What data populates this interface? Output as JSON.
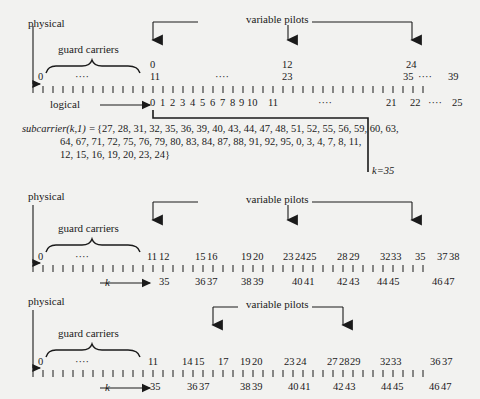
{
  "figure": {
    "background_color": "#f2f2f0",
    "ink_color": "#1a1a1a"
  },
  "common_labels": {
    "physical": "physical",
    "logical": "logical",
    "guard_carriers": "guard carriers",
    "variable_pilots": "variable pilots",
    "k_symbol": "k",
    "dots": "····"
  },
  "formula": {
    "name": "subcarrier(k,1) =",
    "line1": "{27, 28, 31, 32, 35, 36, 39, 40, 43, 44, 47, 48, 51, 52, 55, 56, 59, 60, 63,",
    "line2": "64, 67, 71, 72, 75, 76, 79, 80, 83, 84, 87, 88, 91, 92, 95, 0, 3, 4, 7, 8, 11,",
    "line3": "12, 15, 16, 19, 20, 23, 24}",
    "k_annotation": "k=35"
  },
  "panel1": {
    "name": "panel-physical-logical-top",
    "axis_start_label": "0",
    "axis_end_label": "39",
    "tick_count": 40,
    "physical_upper_row": [
      {
        "label": "0",
        "tick": 11
      },
      {
        "label": "12",
        "tick": 23
      },
      {
        "label": "24",
        "tick": 35
      }
    ],
    "physical_lower_row": [
      {
        "label": "0",
        "tick": 0
      },
      {
        "label": "····",
        "tick": 5
      },
      {
        "label": "11",
        "tick": 11
      },
      {
        "label": "····",
        "tick": 17
      },
      {
        "label": "23",
        "tick": 23
      },
      {
        "label": "35",
        "tick": 35
      },
      {
        "label": "····",
        "tick": 37
      },
      {
        "label": "39",
        "tick": 39
      }
    ],
    "logical_row": [
      {
        "label": "0",
        "tick": 11
      },
      {
        "label": "1",
        "tick": 12
      },
      {
        "label": "2",
        "tick": 13
      },
      {
        "label": "3",
        "tick": 14
      },
      {
        "label": "4",
        "tick": 15
      },
      {
        "label": "5",
        "tick": 16
      },
      {
        "label": "6",
        "tick": 17
      },
      {
        "label": "7",
        "tick": 18
      },
      {
        "label": "8",
        "tick": 19
      },
      {
        "label": "9",
        "tick": 20
      },
      {
        "label": "10",
        "tick": 21
      },
      {
        "label": "11",
        "tick": 23
      },
      {
        "label": "····",
        "tick": 29
      },
      {
        "label": "21",
        "tick": 34
      },
      {
        "label": "22",
        "tick": 36
      },
      {
        "label": "····",
        "tick": 38
      },
      {
        "label": "25",
        "tick": 39
      }
    ],
    "pilot_arrow_ticks": [
      11,
      23,
      35
    ]
  },
  "panel2": {
    "name": "panel-physical-k-middle",
    "axis_start_label": "0",
    "tick_count": 40,
    "physical_row": [
      {
        "label": "0",
        "tick": 0
      },
      {
        "label": "····",
        "tick": 5
      },
      {
        "label": "11",
        "tick": 11
      },
      {
        "label": "12",
        "tick": 12
      },
      {
        "label": "15",
        "tick": 15
      },
      {
        "label": "16",
        "tick": 16
      },
      {
        "label": "19",
        "tick": 19
      },
      {
        "label": "20",
        "tick": 20
      },
      {
        "label": "23",
        "tick": 23
      },
      {
        "label": "24",
        "tick": 24
      },
      {
        "label": "25",
        "tick": 25
      },
      {
        "label": "28",
        "tick": 28
      },
      {
        "label": "29",
        "tick": 29
      },
      {
        "label": "32",
        "tick": 32
      },
      {
        "label": "33",
        "tick": 33
      },
      {
        "label": "35",
        "tick": 35
      },
      {
        "label": "37",
        "tick": 37
      },
      {
        "label": "38",
        "tick": 38
      }
    ],
    "k_row": [
      {
        "label": "35",
        "tick": 12
      },
      {
        "label": "36",
        "tick": 15
      },
      {
        "label": "37",
        "tick": 16
      },
      {
        "label": "38",
        "tick": 19
      },
      {
        "label": "39",
        "tick": 20
      },
      {
        "label": "40",
        "tick": 24
      },
      {
        "label": "41",
        "tick": 25
      },
      {
        "label": "42",
        "tick": 28
      },
      {
        "label": "43",
        "tick": 29
      },
      {
        "label": "44",
        "tick": 32
      },
      {
        "label": "45",
        "tick": 33
      },
      {
        "label": "46",
        "tick": 37
      },
      {
        "label": "47",
        "tick": 38
      }
    ],
    "pilot_arrow_ticks": [
      11,
      23,
      35
    ]
  },
  "panel3": {
    "name": "panel-physical-k-bottom",
    "axis_start_label": "0",
    "tick_count": 40,
    "physical_row": [
      {
        "label": "0",
        "tick": 0
      },
      {
        "label": "····",
        "tick": 5
      },
      {
        "label": "11",
        "tick": 11
      },
      {
        "label": "14",
        "tick": 14
      },
      {
        "label": "15",
        "tick": 15
      },
      {
        "label": "17",
        "tick": 17
      },
      {
        "label": "19",
        "tick": 19
      },
      {
        "label": "20",
        "tick": 20
      },
      {
        "label": "23",
        "tick": 23
      },
      {
        "label": "24",
        "tick": 24
      },
      {
        "label": "27",
        "tick": 27
      },
      {
        "label": "28",
        "tick": 28
      },
      {
        "label": "29",
        "tick": 29
      },
      {
        "label": "32",
        "tick": 32
      },
      {
        "label": "33",
        "tick": 33
      },
      {
        "label": "36",
        "tick": 36
      },
      {
        "label": "37",
        "tick": 37
      }
    ],
    "k_row": [
      {
        "label": "35",
        "tick": 11
      },
      {
        "label": "36",
        "tick": 14
      },
      {
        "label": "37",
        "tick": 15
      },
      {
        "label": "38",
        "tick": 19
      },
      {
        "label": "39",
        "tick": 20
      },
      {
        "label": "40",
        "tick": 23
      },
      {
        "label": "41",
        "tick": 24
      },
      {
        "label": "42",
        "tick": 27
      },
      {
        "label": "43",
        "tick": 28
      },
      {
        "label": "44",
        "tick": 32
      },
      {
        "label": "45",
        "tick": 33
      },
      {
        "label": "46",
        "tick": 36
      },
      {
        "label": "47",
        "tick": 37
      }
    ],
    "pilot_arrow_ticks": [
      17,
      28
    ]
  }
}
